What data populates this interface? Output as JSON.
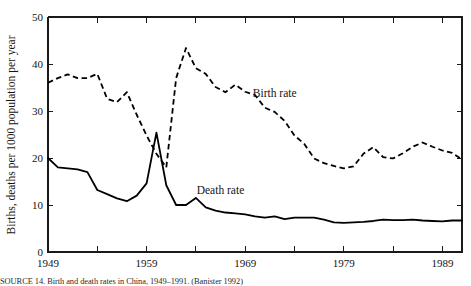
{
  "chart_data": {
    "type": "line",
    "title": "",
    "xlabel": "",
    "ylabel": "Births, deaths per 1000 population per year",
    "xlim": [
      1949,
      1991
    ],
    "ylim": [
      0,
      50
    ],
    "yticks": [
      0,
      10,
      20,
      30,
      40,
      50
    ],
    "yticklabels": [
      "0",
      "10",
      "20",
      "30",
      "40",
      "50"
    ],
    "xticks": [
      1949,
      1954,
      1959,
      1964,
      1969,
      1974,
      1979,
      1984,
      1989
    ],
    "xticklabels": [
      "1949",
      "",
      "1959",
      "",
      "1969",
      "",
      "1979",
      "",
      "1989"
    ],
    "xticklabels_shown": [
      "1949",
      "1959",
      "1969",
      "1979",
      "1989"
    ],
    "grid": false,
    "legend": "inline-annotations",
    "annotations": [
      {
        "text": "Birth rate",
        "x": 1972.0,
        "y": 33.0
      },
      {
        "text": "Death rate",
        "x": 1966.5,
        "y": 12.4
      }
    ],
    "x": [
      1949,
      1950,
      1951,
      1952,
      1953,
      1954,
      1955,
      1956,
      1957,
      1958,
      1959,
      1960,
      1961,
      1962,
      1963,
      1964,
      1965,
      1966,
      1967,
      1968,
      1969,
      1970,
      1971,
      1972,
      1973,
      1974,
      1975,
      1976,
      1977,
      1978,
      1979,
      1980,
      1981,
      1982,
      1983,
      1984,
      1985,
      1986,
      1987,
      1988,
      1989,
      1990,
      1991
    ],
    "series": [
      {
        "name": "Birth rate",
        "style": "dashed",
        "values": [
          36.0,
          37.0,
          37.8,
          37.0,
          37.0,
          37.9,
          32.6,
          31.9,
          34.0,
          29.2,
          24.8,
          20.9,
          18.0,
          37.0,
          43.4,
          39.1,
          37.9,
          35.1,
          34.0,
          35.6,
          34.1,
          33.4,
          30.7,
          29.8,
          27.9,
          24.8,
          23.0,
          19.9,
          18.9,
          18.3,
          17.8,
          18.2,
          20.9,
          22.3,
          20.2,
          19.9,
          21.0,
          22.4,
          23.3,
          22.4,
          21.6,
          21.1,
          19.7
        ]
      },
      {
        "name": "Death rate",
        "style": "solid",
        "values": [
          20.0,
          18.0,
          17.8,
          17.6,
          17.0,
          13.2,
          12.3,
          11.4,
          10.8,
          12.0,
          14.6,
          25.4,
          14.2,
          10.0,
          10.0,
          11.5,
          9.5,
          8.8,
          8.4,
          8.2,
          8.0,
          7.6,
          7.3,
          7.6,
          7.0,
          7.3,
          7.3,
          7.3,
          6.9,
          6.3,
          6.2,
          6.3,
          6.4,
          6.6,
          6.9,
          6.8,
          6.8,
          6.9,
          6.7,
          6.6,
          6.5,
          6.7,
          6.7
        ]
      }
    ]
  },
  "caption": {
    "text": "SOURCE 14.  Birth and death rates in China, 1949–1991. (Banister 1992)"
  }
}
